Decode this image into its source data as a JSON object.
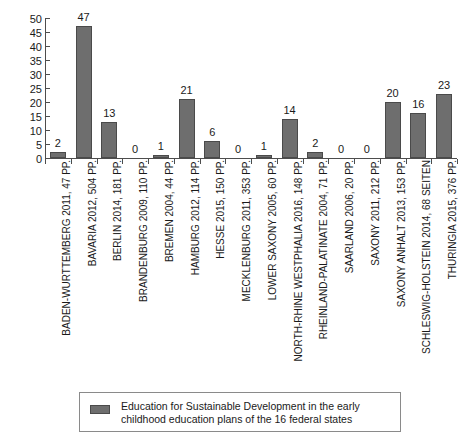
{
  "chart_data": {
    "type": "bar",
    "title": "",
    "xlabel": "",
    "ylabel": "",
    "ylim": [
      0,
      50
    ],
    "ytick_step": 5,
    "grid": false,
    "legend_position": "bottom",
    "bar_color": "#6e6e6e",
    "bar_border_color": "#4a4a4a",
    "axis_color": "#4d4d4d",
    "yticks": [
      "0",
      "5",
      "10",
      "15",
      "20",
      "25",
      "30",
      "35",
      "40",
      "45",
      "50"
    ],
    "categories": [
      "BADEN-WURTTEMBERG 2011, 47 PP.",
      "BAVARIA 2012, 504 PP.",
      "BERLIN 2014, 181 PP.",
      "BRANDENBURG 2009, 110 PP.",
      "BREMEN 2004, 44 PP.",
      "HAMBURG 2012, 114 PP.",
      "HESSE 2015, 150 PP.",
      "MECKLENBURG 2011, 353 PP.",
      "LOWER SAXONY 2005, 60 PP.",
      "NORTH-RHINE WESTPHALIA 2016, 148 PP.",
      "RHEINLAND-PALATINATE 2004, 71 PP.",
      "SAARLAND 2006, 20 PP.",
      "SAXONY 2011, 212 PP.",
      "SAXONY ANHALT 2013, 153 PP.",
      "SCHLESWIG-HOLSTEIN 2014, 68 SEITEN",
      "THURINGIA 2015, 376 PP."
    ],
    "values": [
      2,
      47,
      13,
      0,
      1,
      21,
      6,
      0,
      1,
      14,
      2,
      0,
      0,
      20,
      16,
      23
    ],
    "value_labels": [
      "2",
      "47",
      "13",
      "0",
      "1",
      "21",
      "6",
      "0",
      "1",
      "14",
      "2",
      "0",
      "0",
      "20",
      "16",
      "23"
    ],
    "legend": [
      {
        "label": "Education for Sustainable Development in the early childhood education plans of the 16 federal states",
        "color": "#6e6e6e"
      }
    ]
  }
}
